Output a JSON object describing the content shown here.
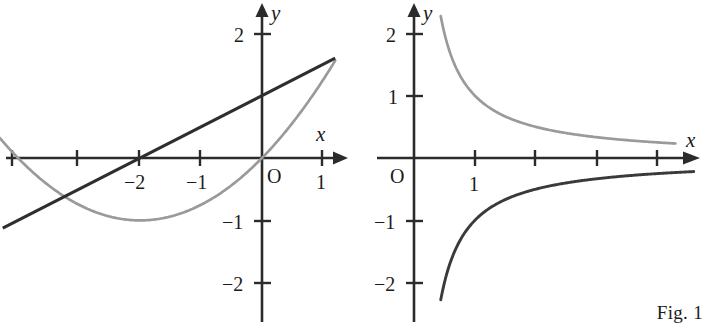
{
  "figure": {
    "caption": "Fig. 1",
    "panel_count": 2
  },
  "labels": {
    "x_axis": "x",
    "y_axis": "y",
    "origin": "O",
    "minus_one": "−1",
    "minus_two": "−2",
    "one": "1",
    "two": "2"
  },
  "chart_data": [
    {
      "type": "line",
      "title": "",
      "subtitle": "",
      "panel": "left",
      "xlabel": "x",
      "ylabel": "y",
      "xlim": [
        -4.2,
        1.4
      ],
      "ylim": [
        -2.4,
        2.3
      ],
      "grid": false,
      "legend": "none",
      "origin_label": "O",
      "xticks": [
        -4,
        -3,
        -2,
        -1,
        1
      ],
      "xtick_labels": [
        "",
        "",
        "−2",
        "−1",
        "1"
      ],
      "yticks": [
        2,
        -1,
        -2
      ],
      "ytick_labels": [
        "2",
        "−1",
        "−2"
      ],
      "series": [
        {
          "name": "parabola",
          "expression": "y = x^2/4 + x",
          "color": "#9a9a9a",
          "style": "solid",
          "x_range": [
            -4.3,
            1.2
          ],
          "key_points": {
            "vertex": [
              -2,
              -1
            ],
            "roots": [
              -4,
              0
            ]
          },
          "x": [
            -4.3,
            -4.0,
            -3.5,
            -3.0,
            -2.5,
            -2.0,
            -1.5,
            -1.0,
            -0.5,
            0.0,
            0.5,
            1.0,
            1.2
          ],
          "values": [
            0.32,
            0.0,
            -0.44,
            -0.75,
            -0.94,
            -1.0,
            -0.94,
            -0.75,
            -0.44,
            0.0,
            0.56,
            1.25,
            1.56
          ]
        },
        {
          "name": "straight-line",
          "expression": "y = x/2 + 1",
          "color": "#2e2e2e",
          "style": "solid",
          "x_range": [
            -4.25,
            1.2
          ],
          "key_points": {
            "y_intercept": [
              0,
              1
            ],
            "x_intercept": [
              -2,
              0
            ]
          },
          "x": [
            -4.25,
            -2.0,
            0.0,
            1.2
          ],
          "values": [
            -1.125,
            0.0,
            1.0,
            1.6
          ]
        }
      ]
    },
    {
      "type": "line",
      "title": "",
      "subtitle": "",
      "panel": "right",
      "xlabel": "x",
      "ylabel": "y",
      "xlim": [
        -0.45,
        4.7
      ],
      "ylim": [
        -2.4,
        2.3
      ],
      "grid": false,
      "legend": "none",
      "origin_label": "O",
      "xticks": [
        1,
        2,
        3,
        4
      ],
      "xtick_labels": [
        "1",
        "",
        "",
        ""
      ],
      "yticks": [
        2,
        1,
        -1,
        -2
      ],
      "ytick_labels": [
        "2",
        "1",
        "−1",
        "−2"
      ],
      "series": [
        {
          "name": "reciprocal-positive",
          "expression": "y = 1/x",
          "color": "#9a9a9a",
          "style": "solid",
          "x_range": [
            0.44,
            4.3
          ],
          "x": [
            0.44,
            0.5,
            0.6,
            0.75,
            1.0,
            1.25,
            1.5,
            2.0,
            2.5,
            3.0,
            3.5,
            4.0,
            4.3
          ],
          "values": [
            2.27,
            2.0,
            1.67,
            1.33,
            1.0,
            0.8,
            0.67,
            0.5,
            0.4,
            0.33,
            0.29,
            0.25,
            0.23
          ]
        },
        {
          "name": "reciprocal-negative",
          "expression": "y = −1/x",
          "color": "#3a3a3a",
          "style": "solid",
          "x_range": [
            0.44,
            4.6
          ],
          "x": [
            0.44,
            0.5,
            0.6,
            0.75,
            1.0,
            1.25,
            1.5,
            2.0,
            2.5,
            3.0,
            3.5,
            4.0,
            4.6
          ],
          "values": [
            -2.27,
            -2.0,
            -1.67,
            -1.33,
            -1.0,
            -0.8,
            -0.67,
            -0.5,
            -0.4,
            -0.33,
            -0.29,
            -0.25,
            -0.22
          ]
        }
      ]
    }
  ]
}
